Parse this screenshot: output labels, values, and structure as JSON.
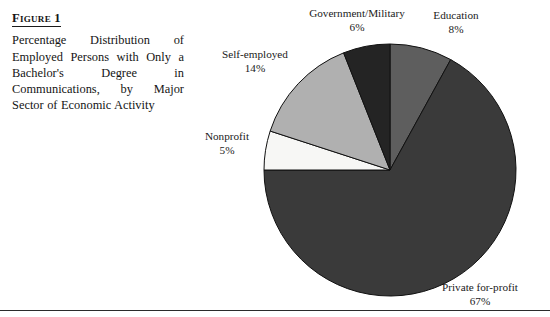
{
  "figure": {
    "label": "Figure 1",
    "caption": "Percentage Distribution of Employed Persons with Only a Bachelor's Degree in Communications, by Major Sector of Economic Activity"
  },
  "labels": {
    "government": {
      "name": "Government/Military",
      "pct": "6%"
    },
    "education": {
      "name": "Education",
      "pct": "8%"
    },
    "self_employed": {
      "name": "Self-employed",
      "pct": "14%"
    },
    "nonprofit": {
      "name": "Nonprofit",
      "pct": "5%"
    },
    "private": {
      "name": "Private for-profit",
      "pct": "67%"
    }
  },
  "chart_data": {
    "type": "pie",
    "title": "Percentage Distribution of Employed Persons with Only a Bachelor's Degree in Communications, by Major Sector of Economic Activity",
    "unit": "percent",
    "start_angle_deg": 0,
    "direction": "clockwise",
    "legend": "none (direct labels with leader-free callouts)",
    "categories": [
      "Education",
      "Private for-profit",
      "Nonprofit",
      "Self-employed",
      "Government/Military"
    ],
    "values": [
      8,
      67,
      5,
      14,
      6
    ],
    "colors": [
      "#5e5e5e",
      "#3a3a3a",
      "#f7f7f5",
      "#b0b0b0",
      "#242424"
    ],
    "slices": [
      {
        "label": "Education",
        "value": 8,
        "color": "#5e5e5e",
        "start_deg": 0,
        "end_deg": 28.8
      },
      {
        "label": "Private for-profit",
        "value": 67,
        "color": "#3a3a3a",
        "start_deg": 28.8,
        "end_deg": 270
      },
      {
        "label": "Nonprofit",
        "value": 5,
        "color": "#f7f7f5",
        "start_deg": 270,
        "end_deg": 288
      },
      {
        "label": "Self-employed",
        "value": 14,
        "color": "#b0b0b0",
        "start_deg": 288,
        "end_deg": 338.4
      },
      {
        "label": "Government/Military",
        "value": 6,
        "color": "#242424",
        "start_deg": 338.4,
        "end_deg": 360
      }
    ],
    "geometry": {
      "cx": 390,
      "cy": 170,
      "r": 126
    },
    "stroke": "#111111"
  }
}
